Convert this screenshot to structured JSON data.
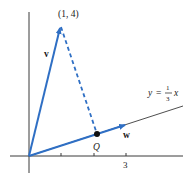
{
  "diagram": {
    "point_label": "(1, 4)",
    "vector_v_label": "v",
    "vector_w_label": "w",
    "line_label": {
      "lhs": "y",
      "equals": "=",
      "numerator": "1",
      "denominator": "3",
      "var": "x"
    },
    "point_q_label": "Q",
    "x_tick_label": "3",
    "colors": {
      "vector": "#2f6fc4",
      "axis": "#3a3a3a",
      "line": "#3a3a3a",
      "point": "#111111"
    }
  }
}
